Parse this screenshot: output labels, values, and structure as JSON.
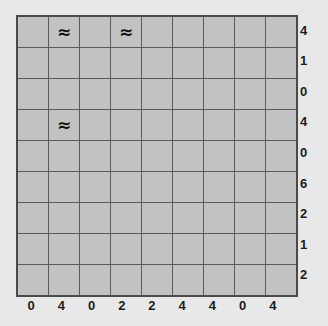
{
  "caption": {
    "text": "· ·"
  },
  "colors": {
    "page_background": "#e8e8e8",
    "cell_fill": "#c2c2c2",
    "gridline": "#5a5a5a",
    "outer_border": "#4a4a4a",
    "label_text": "#1c1c1c",
    "symbol_text": "#111111"
  },
  "chart_data": {
    "type": "heatmap",
    "title": "",
    "xlabel": "",
    "ylabel": "",
    "rows": 9,
    "cols": 9,
    "grid": true,
    "legend_position": "none",
    "column_labels": [
      "0",
      "4",
      "0",
      "2",
      "2",
      "4",
      "4",
      "0",
      "4"
    ],
    "row_labels": [
      "4",
      "1",
      "0",
      "4",
      "0",
      "6",
      "2",
      "1",
      "2"
    ],
    "symbol": "≈",
    "symbol_name": "almost-equal-to",
    "marked_cells": [
      {
        "row": 1,
        "col": 2
      },
      {
        "row": 1,
        "col": 4
      },
      {
        "row": 4,
        "col": 2
      }
    ],
    "cells": [
      [
        "",
        "≈",
        "",
        "≈",
        "",
        "",
        "",
        "",
        ""
      ],
      [
        "",
        "",
        "",
        "",
        "",
        "",
        "",
        "",
        ""
      ],
      [
        "",
        "",
        "",
        "",
        "",
        "",
        "",
        "",
        ""
      ],
      [
        "",
        "≈",
        "",
        "",
        "",
        "",
        "",
        "",
        ""
      ],
      [
        "",
        "",
        "",
        "",
        "",
        "",
        "",
        "",
        ""
      ],
      [
        "",
        "",
        "",
        "",
        "",
        "",
        "",
        "",
        ""
      ],
      [
        "",
        "",
        "",
        "",
        "",
        "",
        "",
        "",
        ""
      ],
      [
        "",
        "",
        "",
        "",
        "",
        "",
        "",
        "",
        ""
      ],
      [
        "",
        "",
        "",
        "",
        "",
        "",
        "",
        "",
        ""
      ]
    ]
  }
}
